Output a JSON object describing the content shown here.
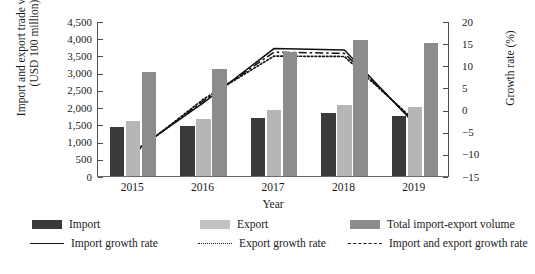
{
  "chart_data": {
    "type": "bar",
    "title": "",
    "xlabel": "Year",
    "ylabel": "Import and export trade volume (USD 100 million)",
    "ylabel_secondary": "Growth rate (%)",
    "categories": [
      "2015",
      "2016",
      "2017",
      "2018",
      "2019"
    ],
    "ylim": [
      0,
      4500
    ],
    "yticks": [
      "0",
      "500",
      "1,000",
      "1,500",
      "2,000",
      "2,500",
      "3,000",
      "3,500",
      "4,000",
      "4,500"
    ],
    "ylim_secondary": [
      -15,
      20
    ],
    "yticks_secondary": [
      "-15",
      "-10",
      "-5",
      "0",
      "5",
      "10",
      "15",
      "20"
    ],
    "grid": false,
    "legend_position": "bottom",
    "series": [
      {
        "name": "Import",
        "type": "bar",
        "axis": "left",
        "color": "#3a3a3a",
        "values": [
          1425,
          1450,
          1690,
          1830,
          1750
        ]
      },
      {
        "name": "Export",
        "type": "bar",
        "axis": "left",
        "color": "#b6b6b6",
        "values": [
          1600,
          1660,
          1920,
          2060,
          2010
        ]
      },
      {
        "name": "Total import-export volume",
        "type": "bar",
        "axis": "left",
        "color": "#8c8c8c",
        "values": [
          3020,
          3110,
          3610,
          3940,
          3860
        ]
      },
      {
        "name": "Import growth rate",
        "type": "line",
        "axis": "right",
        "style": "solid",
        "values": [
          -9.3,
          1.8,
          14.0,
          13.7,
          -3.0
        ]
      },
      {
        "name": "Export growth rate",
        "type": "line",
        "axis": "right",
        "style": "dotted",
        "values": [
          -9.8,
          2.6,
          12.3,
          12.2,
          -2.3
        ]
      },
      {
        "name": "Import and export growth rate",
        "type": "line",
        "axis": "right",
        "style": "dash-dot",
        "values": [
          -9.6,
          2.2,
          13.2,
          12.9,
          -2.7
        ]
      }
    ]
  },
  "axes": {
    "left_title": "Import and export trade volume (USD 100 million)",
    "right_title": "Growth rate (%)",
    "x_title": "Year"
  },
  "legend": {
    "row1": [
      {
        "label": "Import",
        "marker": "swatch-dark"
      },
      {
        "label": "Export",
        "marker": "swatch-light"
      },
      {
        "label": "Total import-export volume",
        "marker": "swatch-mid"
      }
    ],
    "row2": [
      {
        "label": "Import growth rate",
        "marker": "line-solid"
      },
      {
        "label": "Export growth rate",
        "marker": "line-dotted"
      },
      {
        "label": "Import and export growth rate",
        "marker": "line-dash-dot"
      }
    ]
  }
}
